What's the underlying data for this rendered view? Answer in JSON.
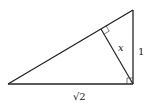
{
  "diagram": {
    "type": "right-triangle-with-altitude",
    "vertices": {
      "A": [
        8,
        84
      ],
      "B": [
        133,
        10
      ],
      "C": [
        133,
        84
      ],
      "H": [
        101,
        29
      ]
    },
    "labels": {
      "altitude": "x",
      "vertical_leg": "1",
      "horizontal_leg": "√2"
    },
    "right_angles": [
      "C",
      "H"
    ],
    "stroke_color": "#222222"
  }
}
